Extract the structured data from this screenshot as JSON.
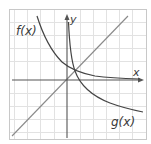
{
  "diagram": {
    "type": "function-graph",
    "frame": {
      "x": 9,
      "y": 9,
      "width": 137,
      "height": 130,
      "border_color": "#c8c8c8"
    },
    "grid": {
      "color": "#e2e2e2",
      "vertical_lines": [
        14,
        27,
        40,
        54,
        80,
        93,
        106,
        119,
        132
      ],
      "horizontal_lines": [
        22,
        35,
        48,
        61,
        93,
        106,
        119,
        132
      ]
    },
    "axes": {
      "color": "#555555",
      "origin": {
        "x": 67,
        "y": 80
      },
      "x_label": "x",
      "y_label": "y"
    },
    "curves": [
      {
        "name": "f(x)",
        "label": "f(x)",
        "color": "#444444",
        "description": "decreasing curve from upper-left, leveling toward x-axis"
      },
      {
        "name": "g(x)",
        "label": "g(x)",
        "color": "#444444",
        "description": "curve hugging y-axis, decreasing toward lower-right"
      },
      {
        "name": "y=x",
        "label": "",
        "color": "#8a8a8a",
        "description": "diagonal line through origin"
      }
    ],
    "intersection": {
      "x": 75,
      "y": 71
    }
  }
}
